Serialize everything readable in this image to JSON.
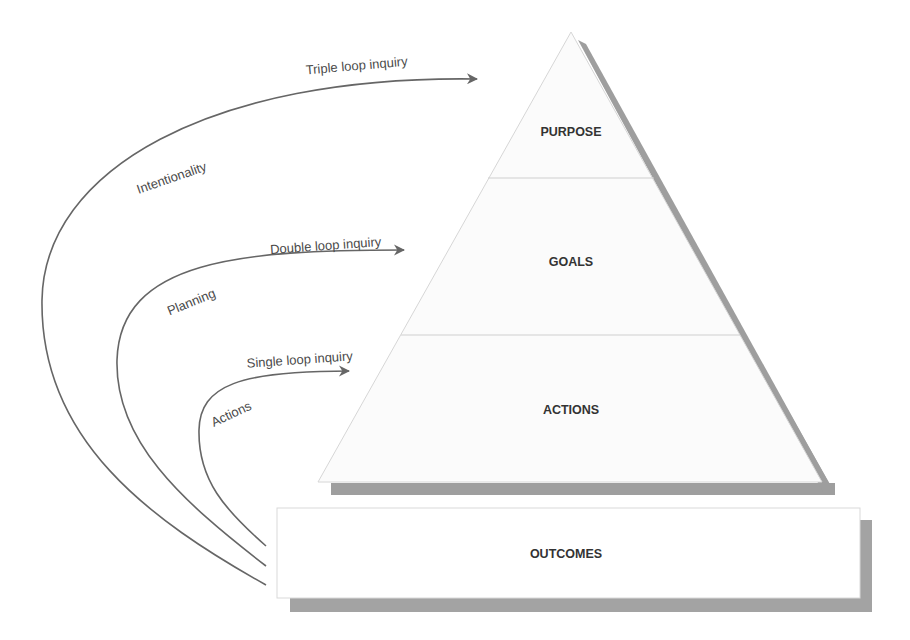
{
  "diagram": {
    "type": "pyramid-with-inquiry-loops",
    "colors": {
      "background": "#ffffff",
      "shape_fill": "#fbfbfb",
      "shape_outline": "#d6d6d6",
      "shadow": "#9e9e9e",
      "curve": "#666666",
      "text_level": "#333333",
      "text_curve": "#4a4a4a"
    },
    "pyramid": {
      "levels": [
        {
          "label": "PURPOSE"
        },
        {
          "label": "GOALS"
        },
        {
          "label": "ACTIONS"
        }
      ]
    },
    "base": {
      "label": "OUTCOMES"
    },
    "loops": [
      {
        "arrow_label": "Triple loop inquiry",
        "path_label": "Intentionality"
      },
      {
        "arrow_label": "Double loop inquiry",
        "path_label": "Planning"
      },
      {
        "arrow_label": "Single loop inquiry",
        "path_label": "Actions"
      }
    ]
  }
}
